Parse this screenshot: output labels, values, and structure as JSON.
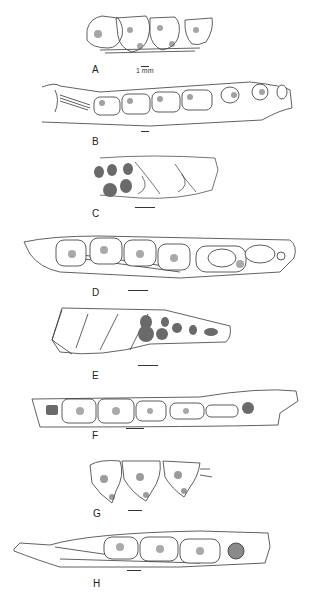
{
  "figure": {
    "panels": [
      {
        "id": "A",
        "label": "A",
        "scale_text": "1 mm"
      },
      {
        "id": "B",
        "label": "B"
      },
      {
        "id": "C",
        "label": "C"
      },
      {
        "id": "D",
        "label": "D"
      },
      {
        "id": "E",
        "label": "E"
      },
      {
        "id": "F",
        "label": "F"
      },
      {
        "id": "G",
        "label": "G"
      },
      {
        "id": "H",
        "label": "H"
      }
    ],
    "colors": {
      "line": "#3a3a3a",
      "fill_dark": "#6a6a6a",
      "shade": "#9a9a9a",
      "bg": "#ffffff"
    }
  }
}
